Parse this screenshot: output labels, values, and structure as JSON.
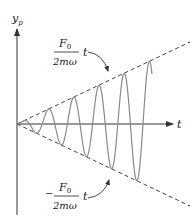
{
  "diagram": {
    "y_axis_label": {
      "main": "y",
      "sub": "p"
    },
    "x_axis_label": "t",
    "upper_envelope": {
      "numerator": "F",
      "numerator_sub": "0",
      "denominator": "2mω",
      "suffix": "t",
      "sign": ""
    },
    "lower_envelope": {
      "numerator": "F",
      "numerator_sub": "0",
      "denominator": "2mω",
      "suffix": "t",
      "sign": "−"
    },
    "colors": {
      "axis": "#333333",
      "wave": "#8a8a8a",
      "envelope": "#444444",
      "text": "#222222"
    }
  },
  "chart_data": {
    "type": "line",
    "title": "",
    "xlabel": "t",
    "ylabel": "y_p",
    "series": [
      {
        "name": "y_p(t) = (F0/2mω) t sin(ωt)",
        "style": "solid"
      },
      {
        "name": "(F0/2mω) t",
        "style": "dashed"
      },
      {
        "name": "-(F0/2mω) t",
        "style": "dashed"
      }
    ],
    "grid": false,
    "legend": "none",
    "annotations": [
      "F0/(2mω) t",
      "-F0/(2mω) t"
    ]
  }
}
